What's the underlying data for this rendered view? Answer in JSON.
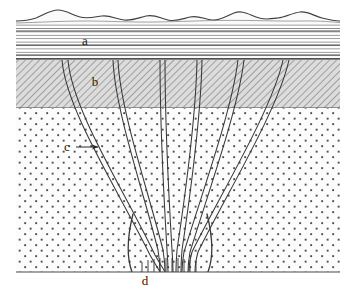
{
  "figure": {
    "type": "geological-cross-section",
    "width": 354,
    "height": 296,
    "background_color": "#ffffff"
  },
  "labels": [
    {
      "id": "a",
      "text": "a",
      "x": 85,
      "y": 45,
      "description": "stratified sedimentary layer with horizontal bedding lines"
    },
    {
      "id": "b",
      "text": "b",
      "x": 95,
      "y": 86,
      "description": "hatched rock layer"
    },
    {
      "id": "c",
      "text": "c",
      "x": 67,
      "y": 151,
      "description": "dike intrusion",
      "has_arrow": true,
      "arrow_from_x": 76,
      "arrow_from_y": 147,
      "arrow_to_x": 98,
      "arrow_to_y": 147
    },
    {
      "id": "d",
      "text": "d",
      "x": 145,
      "y": 285,
      "description": "convergence zone of dikes at depth"
    }
  ],
  "layers": [
    {
      "name": "topography-surface",
      "kind": "wavy-line",
      "top": 8,
      "bottom": 24,
      "fill_color": "#ffffff",
      "stroke_color": "#4a4a4a"
    },
    {
      "name": "stratified-layer-a",
      "kind": "horizontal-bedding",
      "top": 24,
      "bottom": 60,
      "fill_color": "#fdfdfd",
      "stroke_color": "#6a6a6a",
      "line_count": 22
    },
    {
      "name": "hatched-layer-b",
      "kind": "diagonal-hatch",
      "top": 60,
      "bottom": 108,
      "fill_color": "#d8d8d8",
      "stroke_color": "#707070",
      "hatch_angle_deg": 45,
      "hatch_spacing": 5
    },
    {
      "name": "stippled-basement",
      "kind": "dot-stipple",
      "top": 108,
      "bottom": 272,
      "fill_color": "#fbfbfb",
      "dot_color": "#555555",
      "dot_spacing_x": 11,
      "dot_spacing_y": 11,
      "dot_size": 1.9
    }
  ],
  "frame": {
    "left": 16,
    "right": 340,
    "top": 8,
    "bottom": 272,
    "stroke_color": "#5a5a5a"
  },
  "dikes": {
    "description": "Fan-shaped swarm of intrusive dikes converging downward to a central feeder at the base",
    "count": 14,
    "stroke_color": "#3a3a3a",
    "convergence_x": 170,
    "convergence_y": 272,
    "top_x_positions": [
      62,
      89,
      113,
      138,
      160,
      178,
      197,
      213,
      238,
      262,
      283,
      305
    ],
    "paths": [
      "M 62 60 C 66 110, 118 190, 150 255 C 155 264, 158 268, 160 272",
      "M 68 60 C 72 110, 124 190, 155 255 C 160 264, 163 268, 165 272",
      "M 113 60 C 115 110, 143 190, 158 250 C 160 262, 160 268, 160 272",
      "M 118 60 C 120 110, 148 190, 163 250 C 165 262, 165 268, 165 272",
      "M 160 60 C 160 120, 164 200, 167 250 C 168 262, 168 268, 168 272",
      "M 165 60 C 165 120, 169 200, 172 250 C 173 262, 173 268, 173 272",
      "M 197 60 C 196 110, 186 190, 177 250 C 176 262, 176 268, 176 272",
      "M 202 60 C 201 110, 191 190, 182 250 C 181 262, 181 268, 181 272",
      "M 238 60 C 232 110, 203 190, 184 252 C 182 263, 182 268, 182 272",
      "M 244 60 C 238 110, 209 190, 190 252 C 188 263, 188 268, 188 272",
      "M 283 60 C 272 110, 220 195, 192 252 C 189 263, 189 268, 189 272",
      "M 289 60 C 278 110, 226 195, 198 252 C 195 263, 195 268, 195 272",
      "M 132 215 C 128 235, 126 255, 131 272",
      "M 208 215 C 212 235, 214 255, 209 272"
    ],
    "basal_ticks_y_top": 262,
    "basal_ticks_y_bottom": 272,
    "basal_ticks_x": [
      142,
      148,
      154,
      160,
      166,
      172,
      178,
      184,
      190,
      196
    ]
  }
}
